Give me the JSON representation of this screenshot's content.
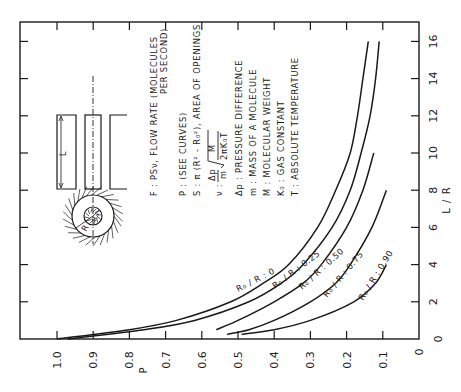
{
  "chart_data": {
    "type": "line",
    "title": "",
    "orientation_note": "Figure is printed rotated 90 degrees: P axis runs along the bottom (1.0 at left to 0 at right); L/R axis runs along the right side (0 at bottom to 16 at top).",
    "xlabel": "L / R",
    "ylabel": "P",
    "xlim": [
      0,
      16
    ],
    "ylim": [
      0,
      1.0
    ],
    "x_ticks": [
      0,
      2,
      4,
      6,
      8,
      10,
      12,
      14,
      16
    ],
    "x_tick_labels": [
      "0",
      "2",
      "4",
      "6",
      "8",
      "10",
      "12",
      "14",
      "16"
    ],
    "y_ticks": [
      1.0,
      0.9,
      0.8,
      0.7,
      0.6,
      0.5,
      0.4,
      0.3,
      0.2,
      0.1,
      0
    ],
    "y_tick_labels": [
      "1.0",
      "0.9",
      "0.8",
      "0.7",
      "0.6",
      "0.5",
      "0.4",
      "0.3",
      "0.2",
      "0.1",
      "0"
    ],
    "grid": false,
    "series": [
      {
        "name": "R₀/R = 0",
        "label": "R₀ / R : 0",
        "points": [
          [
            0,
            1.0
          ],
          [
            0.5,
            0.8
          ],
          [
            1,
            0.67
          ],
          [
            2,
            0.52
          ],
          [
            3,
            0.43
          ],
          [
            4,
            0.36
          ],
          [
            6,
            0.28
          ],
          [
            8,
            0.23
          ],
          [
            10,
            0.19
          ],
          [
            12,
            0.17
          ],
          [
            14,
            0.155
          ],
          [
            16,
            0.14
          ]
        ]
      },
      {
        "name": "R₀/R = 0.25",
        "label": "R₀ / R : 0.25",
        "points": [
          [
            0,
            0.97
          ],
          [
            0.5,
            0.76
          ],
          [
            1,
            0.62
          ],
          [
            2,
            0.47
          ],
          [
            3,
            0.38
          ],
          [
            4,
            0.32
          ],
          [
            6,
            0.24
          ],
          [
            8,
            0.19
          ],
          [
            10,
            0.16
          ],
          [
            12,
            0.135
          ],
          [
            14,
            0.12
          ],
          [
            16,
            0.11
          ]
        ]
      },
      {
        "name": "R₀/R = 0.50",
        "label": "R₀ / R : 0.50",
        "points": [
          [
            0.5,
            0.56
          ],
          [
            1,
            0.5
          ],
          [
            2,
            0.4
          ],
          [
            3,
            0.32
          ],
          [
            4,
            0.27
          ],
          [
            6,
            0.2
          ],
          [
            8,
            0.155
          ],
          [
            10,
            0.125
          ]
        ]
      },
      {
        "name": "R₀/R = 0.75",
        "label": "R₀ / R : 0.75",
        "points": [
          [
            0.25,
            0.53
          ],
          [
            0.5,
            0.47
          ],
          [
            1,
            0.4
          ],
          [
            2,
            0.3
          ],
          [
            3,
            0.23
          ],
          [
            4,
            0.19
          ],
          [
            6,
            0.13
          ],
          [
            8,
            0.09
          ]
        ]
      },
      {
        "name": "R₀/R = 0.90",
        "label": "R₀ / R : 0.90",
        "points": [
          [
            0.25,
            0.49
          ],
          [
            0.5,
            0.4
          ],
          [
            1,
            0.3
          ],
          [
            2,
            0.18
          ],
          [
            3,
            0.12
          ],
          [
            4,
            0.09
          ]
        ]
      }
    ],
    "legend_position": "inside-top-center (rotated)",
    "annotations": {
      "definitions": [
        "F : P S ν ,  FLOW RATE ( MOLECULES",
        "PER SECOND)",
        "P : ( SEE  CURVES )",
        "S : π (R² - R₀²) ,  AREA  OF  OPENINGS",
        "ν : Δp/m √( M / 2πK₀T )",
        "Δp : PRESSURE  DIFFERENCE",
        "m : MASS  OF  A  MOLECULE",
        "M : MOLECULAR  WEIGHT",
        "K₀ : GAS  CONSTANT",
        "T : ABSOLUTE  TEMPERATURE"
      ],
      "diagram": {
        "description": "Annular tube cross-section with length L and radii R (outer) and R₀ (inner)",
        "labels": [
          "L",
          "R",
          "R₀"
        ]
      }
    }
  },
  "text": {
    "def_F_1": "F : PSν, FLOW RATE (MOLECULES",
    "def_F_2": "PER SECOND)",
    "def_P": "P : (SEE  CURVES)",
    "def_S": "S : π (R² - R₀²), AREA  OF  OPENINGS",
    "def_nu_prefix": "ν :",
    "def_nu_num": "Δp",
    "def_nu_den": "m",
    "def_nu_root_num": "M",
    "def_nu_root_den": "2πK₀T",
    "def_dp": "Δp : PRESSURE  DIFFERENCE",
    "def_m": "m : MASS  OF  A  MOLECULE",
    "def_M": "M : MOLECULAR  WEIGHT",
    "def_K": "K₀ : GAS  CONSTANT",
    "def_T": "T : ABSOLUTE  TEMPERATURE",
    "diag_L": "L",
    "diag_R": "R",
    "diag_R0": "R₀",
    "axis_P": "P",
    "axis_LR": "L / R",
    "label_0": "R₀ / R : 0",
    "label_025": "R₀ / R : 0.25",
    "label_050": "R₀ / R : 0.50",
    "label_075": "R₀ / R : 0.75",
    "label_090": "R₀ / R : 0.90",
    "tick_P": [
      "1.0",
      "0.9",
      "0.8",
      "0.7",
      "0.6",
      "0.5",
      "0.4",
      "0.3",
      "0.2",
      "0.1",
      "0"
    ],
    "tick_LR": [
      "0",
      "2",
      "4",
      "6",
      "8",
      "10",
      "12",
      "14",
      "16"
    ]
  },
  "colors": {
    "ink": "#1a1a1a",
    "paper": "#ffffff"
  }
}
